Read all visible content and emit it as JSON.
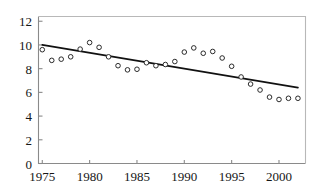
{
  "chart_data": {
    "type": "scatter",
    "title": "",
    "subtitle": "",
    "xlabel": "",
    "ylabel": "",
    "xlim": [
      1974.6,
      2002.8
    ],
    "ylim": [
      0,
      12.4
    ],
    "grid": false,
    "legend": "none",
    "x_tick_labels": [
      "1975",
      "1980",
      "1985",
      "1990",
      "1995",
      "2000"
    ],
    "x_tick_values": [
      1975,
      1980,
      1985,
      1990,
      1995,
      2000
    ],
    "y_tick_labels": [
      "0",
      "2",
      "4",
      "6",
      "8",
      "10",
      "12"
    ],
    "y_tick_values": [
      0,
      2,
      4,
      6,
      8,
      10,
      12
    ],
    "x": [
      1975,
      1976,
      1977,
      1978,
      1979,
      1980,
      1981,
      1982,
      1983,
      1984,
      1985,
      1986,
      1987,
      1988,
      1989,
      1990,
      1991,
      1992,
      1993,
      1994,
      1995,
      1996,
      1997,
      1998,
      1999,
      2000,
      2001,
      2002
    ],
    "values": [
      9.6,
      8.7,
      8.8,
      9.0,
      9.65,
      10.2,
      9.8,
      9.0,
      8.25,
      7.9,
      7.95,
      8.5,
      8.25,
      8.35,
      8.6,
      9.4,
      9.75,
      9.3,
      9.45,
      8.9,
      8.2,
      7.3,
      6.7,
      6.2,
      5.6,
      5.4,
      5.5,
      5.5
    ],
    "series": [
      {
        "name": "observations",
        "marker": "open-circle",
        "color": "#1a1a1a",
        "values": [
          9.6,
          8.7,
          8.8,
          9.0,
          9.65,
          10.2,
          9.8,
          9.0,
          8.25,
          7.9,
          7.95,
          8.5,
          8.25,
          8.35,
          8.6,
          9.4,
          9.75,
          9.3,
          9.45,
          8.9,
          8.2,
          7.3,
          6.7,
          6.2,
          5.6,
          5.4,
          5.5,
          5.5
        ]
      },
      {
        "name": "trend-line",
        "marker": "none",
        "color": "#111111",
        "x_endpoints": [
          1975,
          2002
        ],
        "y_endpoints": [
          10.0,
          6.4
        ]
      }
    ],
    "axis_color": "#8a8a8a",
    "marker_edge_color": "#2b2b2b",
    "marker_face_color": "#ffffff",
    "trendline_color": "#111111"
  }
}
